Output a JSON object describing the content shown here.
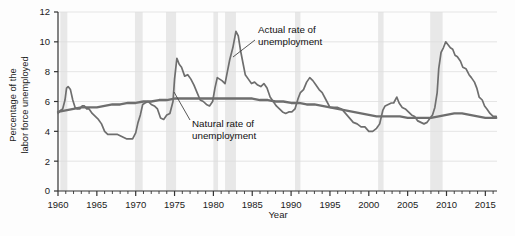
{
  "chart_data": {
    "type": "line",
    "title": "",
    "xlabel": "Year",
    "ylabel": "Percentage of the labor force unemployed",
    "ylabel_line1": "Percentage of the",
    "ylabel_line2": "labor force unemployed",
    "xlim": [
      1960,
      2016.5
    ],
    "ylim": [
      0,
      12
    ],
    "yticks": [
      0,
      2,
      4,
      6,
      8,
      10,
      12
    ],
    "ytick_labels": [
      "0",
      "2",
      "4",
      "6",
      "8",
      "10",
      "12"
    ],
    "xticks": [
      1960,
      1965,
      1970,
      1975,
      1980,
      1985,
      1990,
      1995,
      2000,
      2005,
      2010,
      2015
    ],
    "xtick_labels": [
      "1960",
      "1965",
      "1970",
      "1975",
      "1980",
      "1985",
      "1990",
      "1995",
      "2000",
      "2005",
      "2010",
      "2015"
    ],
    "minor_xtick_interval": 1,
    "grid": "horizontal",
    "legend": "none",
    "line_color": "#6e6e6e",
    "shading_color": "#e8e8e8",
    "annotations": [
      {
        "name": "actual-rate-annotation",
        "line1": "Actual rate of",
        "line2": "unemployment",
        "x": 1983.6,
        "y": 10.6
      },
      {
        "name": "natural-rate-annotation",
        "line1": "Natural rate of",
        "line2": "unemployment",
        "x": 1975.2,
        "y": 4.35
      }
    ],
    "recessions": [
      {
        "start": 1960.3,
        "end": 1961.2
      },
      {
        "start": 1969.9,
        "end": 1970.9
      },
      {
        "start": 1973.9,
        "end": 1975.2
      },
      {
        "start": 1980.0,
        "end": 1980.6
      },
      {
        "start": 1981.5,
        "end": 1982.9
      },
      {
        "start": 1990.5,
        "end": 1991.2
      },
      {
        "start": 2001.2,
        "end": 2001.9
      },
      {
        "start": 2007.9,
        "end": 2009.5
      }
    ],
    "series": [
      {
        "name": "Actual rate of unemployment",
        "points": [
          [
            1960.0,
            5.2
          ],
          [
            1960.3,
            5.4
          ],
          [
            1960.6,
            5.5
          ],
          [
            1960.9,
            6.1
          ],
          [
            1961.1,
            6.9
          ],
          [
            1961.3,
            7.0
          ],
          [
            1961.6,
            6.8
          ],
          [
            1961.9,
            6.1
          ],
          [
            1962.2,
            5.6
          ],
          [
            1962.5,
            5.5
          ],
          [
            1962.8,
            5.5
          ],
          [
            1963.1,
            5.7
          ],
          [
            1963.4,
            5.7
          ],
          [
            1963.7,
            5.5
          ],
          [
            1964.0,
            5.5
          ],
          [
            1964.4,
            5.2
          ],
          [
            1964.8,
            5.0
          ],
          [
            1965.2,
            4.8
          ],
          [
            1965.6,
            4.5
          ],
          [
            1966.0,
            4.0
          ],
          [
            1966.4,
            3.8
          ],
          [
            1966.8,
            3.8
          ],
          [
            1967.2,
            3.8
          ],
          [
            1967.6,
            3.8
          ],
          [
            1968.0,
            3.7
          ],
          [
            1968.4,
            3.6
          ],
          [
            1968.8,
            3.5
          ],
          [
            1969.2,
            3.5
          ],
          [
            1969.6,
            3.5
          ],
          [
            1970.0,
            3.9
          ],
          [
            1970.3,
            4.6
          ],
          [
            1970.6,
            5.1
          ],
          [
            1970.9,
            5.8
          ],
          [
            1971.2,
            5.9
          ],
          [
            1971.6,
            6.0
          ],
          [
            1972.0,
            5.8
          ],
          [
            1972.4,
            5.7
          ],
          [
            1972.8,
            5.5
          ],
          [
            1973.2,
            4.9
          ],
          [
            1973.6,
            4.8
          ],
          [
            1974.0,
            5.1
          ],
          [
            1974.4,
            5.2
          ],
          [
            1974.8,
            6.0
          ],
          [
            1975.0,
            7.5
          ],
          [
            1975.3,
            8.9
          ],
          [
            1975.6,
            8.5
          ],
          [
            1975.9,
            8.3
          ],
          [
            1976.3,
            7.7
          ],
          [
            1976.7,
            7.8
          ],
          [
            1977.1,
            7.5
          ],
          [
            1977.5,
            7.1
          ],
          [
            1977.9,
            6.6
          ],
          [
            1978.3,
            6.1
          ],
          [
            1978.7,
            6.0
          ],
          [
            1979.1,
            5.8
          ],
          [
            1979.5,
            5.7
          ],
          [
            1979.9,
            6.0
          ],
          [
            1980.2,
            6.9
          ],
          [
            1980.5,
            7.6
          ],
          [
            1980.8,
            7.5
          ],
          [
            1981.1,
            7.4
          ],
          [
            1981.5,
            7.2
          ],
          [
            1981.8,
            8.0
          ],
          [
            1982.1,
            8.8
          ],
          [
            1982.5,
            9.6
          ],
          [
            1982.9,
            10.7
          ],
          [
            1983.2,
            10.4
          ],
          [
            1983.5,
            9.4
          ],
          [
            1983.8,
            8.6
          ],
          [
            1984.1,
            7.8
          ],
          [
            1984.5,
            7.5
          ],
          [
            1984.9,
            7.2
          ],
          [
            1985.3,
            7.3
          ],
          [
            1985.7,
            7.1
          ],
          [
            1986.1,
            7.0
          ],
          [
            1986.5,
            7.2
          ],
          [
            1986.9,
            6.9
          ],
          [
            1987.3,
            6.3
          ],
          [
            1987.7,
            6.0
          ],
          [
            1988.1,
            5.7
          ],
          [
            1988.5,
            5.5
          ],
          [
            1988.9,
            5.3
          ],
          [
            1989.3,
            5.2
          ],
          [
            1989.7,
            5.3
          ],
          [
            1990.1,
            5.3
          ],
          [
            1990.5,
            5.5
          ],
          [
            1990.9,
            6.2
          ],
          [
            1991.2,
            6.6
          ],
          [
            1991.6,
            6.8
          ],
          [
            1992.0,
            7.3
          ],
          [
            1992.4,
            7.6
          ],
          [
            1992.8,
            7.4
          ],
          [
            1993.2,
            7.1
          ],
          [
            1993.6,
            6.8
          ],
          [
            1994.0,
            6.6
          ],
          [
            1994.5,
            6.1
          ],
          [
            1995.0,
            5.6
          ],
          [
            1995.5,
            5.6
          ],
          [
            1996.0,
            5.6
          ],
          [
            1996.5,
            5.5
          ],
          [
            1997.0,
            5.2
          ],
          [
            1997.5,
            4.9
          ],
          [
            1998.0,
            4.6
          ],
          [
            1998.5,
            4.5
          ],
          [
            1999.0,
            4.3
          ],
          [
            1999.5,
            4.3
          ],
          [
            2000.0,
            4.0
          ],
          [
            2000.5,
            4.0
          ],
          [
            2001.0,
            4.2
          ],
          [
            2001.4,
            4.5
          ],
          [
            2001.8,
            5.4
          ],
          [
            2002.1,
            5.7
          ],
          [
            2002.5,
            5.8
          ],
          [
            2002.9,
            5.9
          ],
          [
            2003.2,
            5.9
          ],
          [
            2003.6,
            6.3
          ],
          [
            2003.9,
            5.9
          ],
          [
            2004.3,
            5.6
          ],
          [
            2004.7,
            5.5
          ],
          [
            2005.1,
            5.3
          ],
          [
            2005.5,
            5.1
          ],
          [
            2005.9,
            5.0
          ],
          [
            2006.3,
            4.7
          ],
          [
            2006.7,
            4.6
          ],
          [
            2007.1,
            4.5
          ],
          [
            2007.5,
            4.6
          ],
          [
            2007.9,
            4.9
          ],
          [
            2008.2,
            5.1
          ],
          [
            2008.5,
            5.6
          ],
          [
            2008.8,
            6.6
          ],
          [
            2009.0,
            8.2
          ],
          [
            2009.3,
            9.3
          ],
          [
            2009.6,
            9.6
          ],
          [
            2009.9,
            10.0
          ],
          [
            2010.2,
            9.8
          ],
          [
            2010.5,
            9.6
          ],
          [
            2010.8,
            9.5
          ],
          [
            2011.1,
            9.1
          ],
          [
            2011.4,
            9.0
          ],
          [
            2011.8,
            8.7
          ],
          [
            2012.1,
            8.3
          ],
          [
            2012.5,
            8.2
          ],
          [
            2012.9,
            7.8
          ],
          [
            2013.2,
            7.6
          ],
          [
            2013.6,
            7.3
          ],
          [
            2013.9,
            6.9
          ],
          [
            2014.2,
            6.3
          ],
          [
            2014.6,
            6.1
          ],
          [
            2014.9,
            5.7
          ],
          [
            2015.2,
            5.5
          ],
          [
            2015.6,
            5.2
          ],
          [
            2016.0,
            5.0
          ],
          [
            2016.4,
            5.0
          ]
        ]
      },
      {
        "name": "Natural rate of unemployment",
        "points": [
          [
            1960.0,
            5.3
          ],
          [
            1961.0,
            5.4
          ],
          [
            1962.0,
            5.5
          ],
          [
            1963.0,
            5.6
          ],
          [
            1964.0,
            5.6
          ],
          [
            1965.0,
            5.6
          ],
          [
            1966.0,
            5.7
          ],
          [
            1967.0,
            5.8
          ],
          [
            1968.0,
            5.8
          ],
          [
            1969.0,
            5.9
          ],
          [
            1970.0,
            5.9
          ],
          [
            1971.0,
            6.0
          ],
          [
            1972.0,
            6.0
          ],
          [
            1973.0,
            6.1
          ],
          [
            1974.0,
            6.1
          ],
          [
            1975.0,
            6.2
          ],
          [
            1976.0,
            6.2
          ],
          [
            1977.0,
            6.2
          ],
          [
            1978.0,
            6.2
          ],
          [
            1979.0,
            6.2
          ],
          [
            1980.0,
            6.2
          ],
          [
            1981.0,
            6.2
          ],
          [
            1982.0,
            6.2
          ],
          [
            1983.0,
            6.2
          ],
          [
            1984.0,
            6.2
          ],
          [
            1985.0,
            6.2
          ],
          [
            1986.0,
            6.1
          ],
          [
            1987.0,
            6.1
          ],
          [
            1988.0,
            6.0
          ],
          [
            1989.0,
            6.0
          ],
          [
            1990.0,
            5.9
          ],
          [
            1991.0,
            5.9
          ],
          [
            1992.0,
            5.8
          ],
          [
            1993.0,
            5.8
          ],
          [
            1994.0,
            5.7
          ],
          [
            1995.0,
            5.6
          ],
          [
            1996.0,
            5.5
          ],
          [
            1997.0,
            5.4
          ],
          [
            1998.0,
            5.3
          ],
          [
            1999.0,
            5.2
          ],
          [
            2000.0,
            5.1
          ],
          [
            2001.0,
            5.0
          ],
          [
            2002.0,
            5.0
          ],
          [
            2003.0,
            5.0
          ],
          [
            2004.0,
            5.0
          ],
          [
            2005.0,
            4.9
          ],
          [
            2006.0,
            4.9
          ],
          [
            2007.0,
            4.9
          ],
          [
            2008.0,
            4.9
          ],
          [
            2009.0,
            5.0
          ],
          [
            2010.0,
            5.1
          ],
          [
            2011.0,
            5.2
          ],
          [
            2012.0,
            5.2
          ],
          [
            2013.0,
            5.1
          ],
          [
            2014.0,
            5.0
          ],
          [
            2015.0,
            4.9
          ],
          [
            2016.4,
            4.9
          ]
        ]
      }
    ]
  }
}
